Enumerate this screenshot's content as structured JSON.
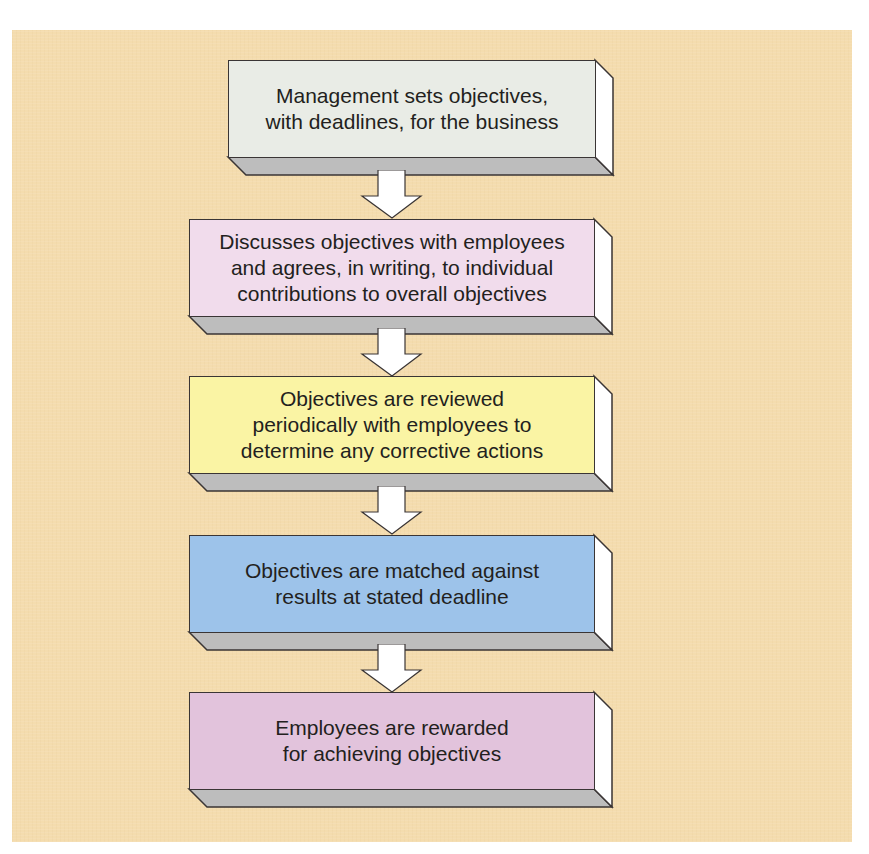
{
  "diagram": {
    "type": "flowchart",
    "direction": "top-to-bottom",
    "background_color": "#f4dcae",
    "steps": [
      {
        "id": 1,
        "label": "Management sets objectives,\nwith deadlines, for the business",
        "color": "#e9ece6"
      },
      {
        "id": 2,
        "label": "Discusses objectives with employees\nand agrees, in writing, to individual\ncontributions to overall objectives",
        "color": "#f1dcec"
      },
      {
        "id": 3,
        "label": "Objectives are reviewed\nperiodically with employees to\ndetermine any corrective actions",
        "color": "#faf4a4"
      },
      {
        "id": 4,
        "label": "Objectives are matched against\nresults at stated deadline",
        "color": "#9dc3ea"
      },
      {
        "id": 5,
        "label": "Employees are rewarded\nfor achieving objectives",
        "color": "#e2c3dc"
      }
    ],
    "connectors": [
      {
        "from": 1,
        "to": 2,
        "style": "block-arrow",
        "color": "#ffffff"
      },
      {
        "from": 2,
        "to": 3,
        "style": "block-arrow",
        "color": "#ffffff"
      },
      {
        "from": 3,
        "to": 4,
        "style": "block-arrow",
        "color": "#ffffff"
      },
      {
        "from": 4,
        "to": 5,
        "style": "block-arrow",
        "color": "#ffffff"
      }
    ],
    "bevel_colors": {
      "bottom": "#bdbdbd",
      "side": "#ffffff",
      "outline": "#3a3535"
    }
  }
}
